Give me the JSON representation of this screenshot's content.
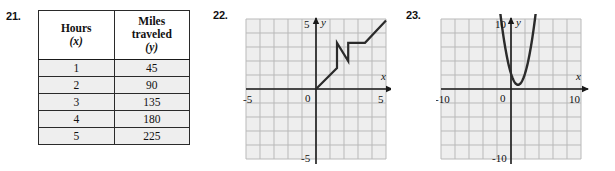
{
  "page": {
    "problems": [
      {
        "number": "21.",
        "kind": "table"
      },
      {
        "number": "22.",
        "kind": "graph"
      },
      {
        "number": "23.",
        "kind": "graph"
      }
    ]
  },
  "problem21": {
    "number": "21.",
    "table": {
      "headers": [
        {
          "main": "Hours",
          "sub": "(x)"
        },
        {
          "main": "Miles traveled",
          "sub": "(y)"
        }
      ],
      "header_lines": {
        "col1_line1": "Hours",
        "col1_line2": "(x)",
        "col2_line1": "Miles",
        "col2_line2": "traveled",
        "col2_line3": "(y)"
      },
      "rows": [
        {
          "x": "1",
          "y": "45"
        },
        {
          "x": "2",
          "y": "90"
        },
        {
          "x": "3",
          "y": "135"
        },
        {
          "x": "4",
          "y": "180"
        },
        {
          "x": "5",
          "y": "225"
        }
      ]
    }
  },
  "problem22": {
    "number": "22.",
    "chart_data": {
      "type": "line",
      "title": "",
      "xlabel": "x",
      "ylabel": "y",
      "xlim": [
        -5,
        5
      ],
      "ylim": [
        -5,
        5
      ],
      "grid": true,
      "legend": "none",
      "x_tick_labels": [
        "-5",
        "5"
      ],
      "y_tick_labels": [
        "5",
        "-5"
      ],
      "origin_label": "0",
      "points": [
        [
          0,
          0
        ],
        [
          1.5,
          1.5
        ],
        [
          1.5,
          3.3
        ],
        [
          2.3,
          2.0
        ],
        [
          2.3,
          3.3
        ],
        [
          3.5,
          3.3
        ],
        [
          5,
          4.9
        ]
      ]
    }
  },
  "problem23": {
    "number": "23.",
    "chart_data": {
      "type": "line",
      "title": "",
      "xlabel": "x",
      "ylabel": "y",
      "xlim": [
        -10,
        10
      ],
      "ylim": [
        -10,
        10
      ],
      "grid": true,
      "legend": "none",
      "x_tick_labels": [
        "-10",
        "10"
      ],
      "y_tick_labels": [
        "10",
        "-10"
      ],
      "origin_label": "0",
      "curve": "parabola",
      "vertex": [
        1,
        0.6
      ],
      "a": 1.6,
      "x_domain": [
        -1.6,
        3.6
      ]
    }
  },
  "colors": {
    "ink": "#111111",
    "grid_line": "#b9b9b9",
    "grid_fill": "#eeeeee",
    "axis": "#1a1a1a",
    "curve": "#2b2b2b",
    "table_cell_fill": "#eeeeee"
  }
}
